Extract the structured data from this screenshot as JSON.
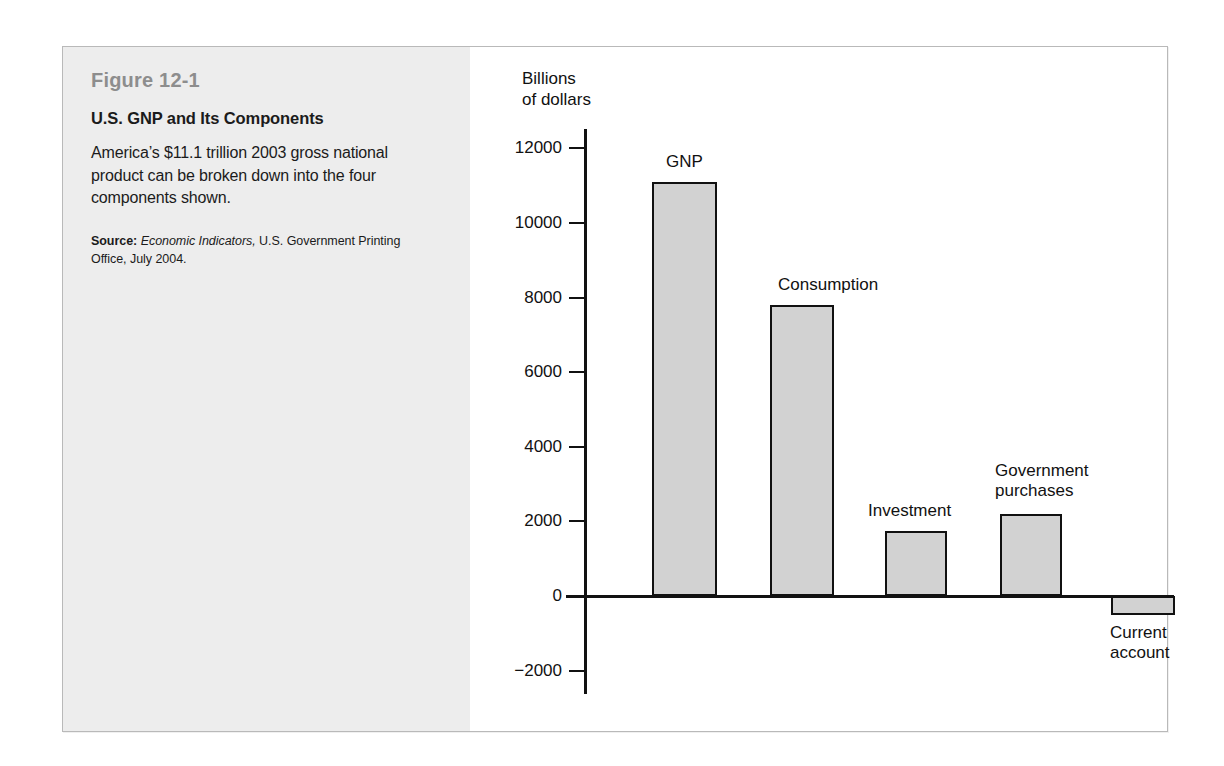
{
  "figure": {
    "number": "Figure 12-1",
    "title": "U.S. GNP and Its Components",
    "description": "America’s $11.1 trillion 2003 gross national product can be broken down into the four components shown.",
    "source_label": "Source:",
    "source_publication": "Economic Indicators,",
    "source_rest": " U.S. Government Printing Office, July 2004."
  },
  "chart_data": {
    "type": "bar",
    "title": "U.S. GNP and Its Components",
    "xlabel": "",
    "ylabel": "Billions\nof dollars",
    "ylim": [
      -2000,
      12000
    ],
    "yticks": [
      12000,
      10000,
      8000,
      6000,
      4000,
      2000,
      0,
      -2000
    ],
    "ytick_labels": [
      "12000",
      "10000",
      "8000",
      "6000",
      "4000",
      "2000",
      "0",
      "−2000"
    ],
    "grid": false,
    "legend": "none",
    "categories": [
      "GNP",
      "Consumption",
      "Investment",
      "Government purchases",
      "Current account"
    ],
    "values": [
      11100,
      7800,
      1750,
      2200,
      -500
    ],
    "bar_color": "#d2d2d2",
    "bar_edge_color": "#111111",
    "labels": [
      {
        "text": "GNP",
        "value": 11100
      },
      {
        "text": "Consumption",
        "value": 7800
      },
      {
        "text": "Investment",
        "value": 1750
      },
      {
        "text": "Government\npurchases",
        "value": 2200
      },
      {
        "text": "Current\naccount",
        "value": -500
      }
    ]
  }
}
